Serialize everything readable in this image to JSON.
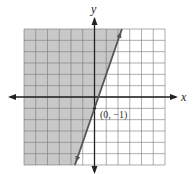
{
  "chart_data": {
    "type": "inequality-graph",
    "title": "",
    "xlabel": "x",
    "ylabel": "y",
    "xlim": [
      -6,
      6
    ],
    "ylim": [
      -6,
      6
    ],
    "grid": true,
    "grid_step": 1,
    "boundary_line": {
      "equation": "y = 3x - 1",
      "slope": 3,
      "y_intercept": -1,
      "style": "solid",
      "color": "#555555"
    },
    "shaded_region": {
      "inequality": "y >= 3x - 1",
      "side": "left/above",
      "color": "#c8c8c8"
    },
    "annotations": [
      {
        "text": "(0, −1)",
        "x": 0,
        "y": -1
      }
    ]
  },
  "labels": {
    "x_axis": "x",
    "y_axis": "y",
    "point": "(0, −1)"
  },
  "colors": {
    "grid": "#777777",
    "axis": "#222222",
    "shade": "#c8c8c8",
    "line": "#555555"
  }
}
